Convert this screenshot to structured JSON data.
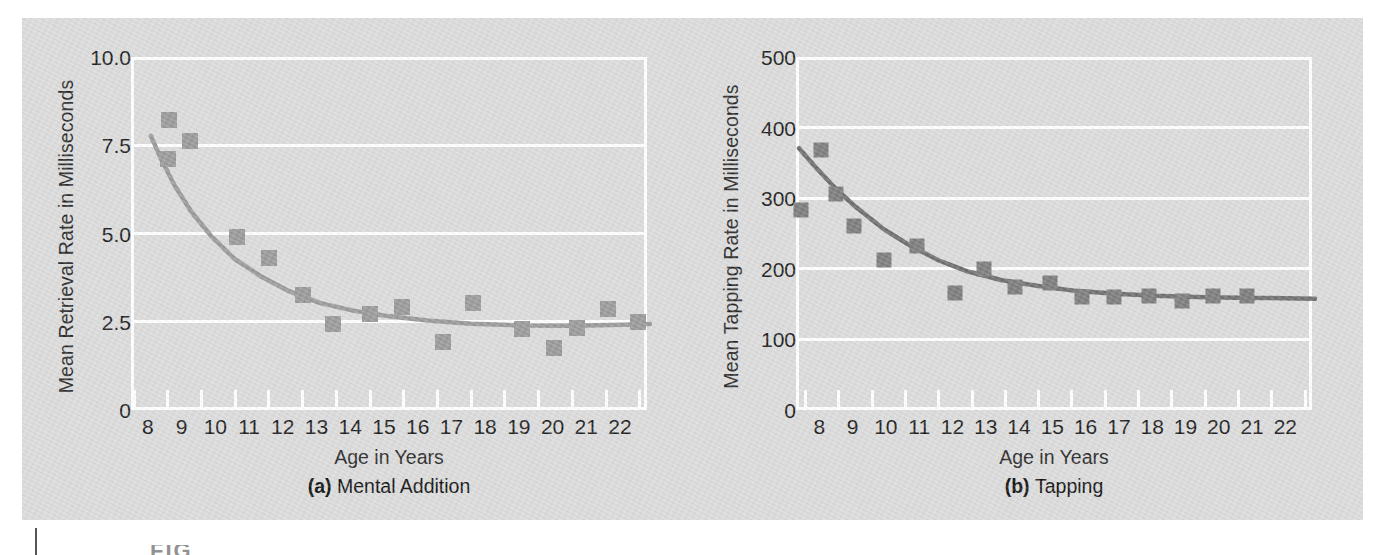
{
  "figure": {
    "background_color": "#dcdcdc",
    "grid_color": "#ffffff",
    "marker_color_a": "#9a9a9a",
    "marker_color_b": "#7d7d7d",
    "curve_color_a": "#9a9a9a",
    "curve_color_b": "#6f6f6f",
    "cut_text": "FIG"
  },
  "chart_data": [
    {
      "type": "scatter",
      "panel": "a",
      "title": "Mental Addition",
      "panel_letter": "(a)",
      "subcaption": "Mental Addition",
      "xlabel": "Age in Years",
      "ylabel": "Mean Retrieval Rate in Milliseconds",
      "xlim": [
        7.5,
        22.8
      ],
      "ylim": [
        0,
        10.0
      ],
      "grid": true,
      "legend": "none",
      "yticks": [
        0,
        2.5,
        5.0,
        7.5,
        10.0
      ],
      "ytick_labels": [
        "0",
        "2.5",
        "5.0",
        "7.5",
        "10.0"
      ],
      "xticks": [
        8,
        9,
        10,
        11,
        12,
        13,
        14,
        15,
        16,
        17,
        18,
        19,
        20,
        21,
        22
      ],
      "xtick_labels": [
        "8",
        "9",
        "10",
        "11",
        "12",
        "13",
        "14",
        "15",
        "16",
        "17",
        "18",
        "19",
        "20",
        "21",
        "22"
      ],
      "points": [
        {
          "x": 8.55,
          "y": 8.3
        },
        {
          "x": 8.5,
          "y": 7.2
        },
        {
          "x": 9.15,
          "y": 7.7
        },
        {
          "x": 10.55,
          "y": 4.98
        },
        {
          "x": 11.5,
          "y": 4.38
        },
        {
          "x": 12.5,
          "y": 3.35
        },
        {
          "x": 13.4,
          "y": 2.52
        },
        {
          "x": 14.5,
          "y": 2.8
        },
        {
          "x": 15.45,
          "y": 3.0
        },
        {
          "x": 16.65,
          "y": 2.0
        },
        {
          "x": 17.55,
          "y": 3.12
        },
        {
          "x": 19.0,
          "y": 2.38
        },
        {
          "x": 19.95,
          "y": 1.85
        },
        {
          "x": 20.65,
          "y": 2.4
        },
        {
          "x": 21.55,
          "y": 2.95
        },
        {
          "x": 22.45,
          "y": 2.57
        }
      ],
      "fit_curve": {
        "description": "decaying power fit",
        "x": [
          8.0,
          8.3,
          8.7,
          9.2,
          9.8,
          10.5,
          11.3,
          12.1,
          13.0,
          14.0,
          15.0,
          16.2,
          17.5,
          19.0,
          20.5,
          22.0,
          22.8
        ],
        "y": [
          7.85,
          7.2,
          6.45,
          5.7,
          5.0,
          4.35,
          3.85,
          3.45,
          3.12,
          2.9,
          2.75,
          2.62,
          2.53,
          2.48,
          2.47,
          2.5,
          2.52
        ]
      }
    },
    {
      "type": "scatter",
      "panel": "b",
      "title": "Tapping",
      "panel_letter": "(b)",
      "subcaption": "Tapping",
      "xlabel": "Age in Years",
      "ylabel": "Mean Tapping Rate in Milliseconds",
      "xlim": [
        7.3,
        22.8
      ],
      "ylim": [
        0,
        500
      ],
      "grid": true,
      "legend": "none",
      "yticks": [
        0,
        100,
        200,
        300,
        400,
        500
      ],
      "ytick_labels": [
        "0",
        "100",
        "200",
        "300",
        "400",
        "500"
      ],
      "xticks": [
        8,
        9,
        10,
        11,
        12,
        13,
        14,
        15,
        16,
        17,
        18,
        19,
        20,
        21,
        22
      ],
      "xtick_labels": [
        "8",
        "9",
        "10",
        "11",
        "12",
        "13",
        "14",
        "15",
        "16",
        "17",
        "18",
        "19",
        "20",
        "21",
        "22"
      ],
      "points": [
        {
          "x": 7.35,
          "y": 288
        },
        {
          "x": 7.95,
          "y": 373
        },
        {
          "x": 8.4,
          "y": 310
        },
        {
          "x": 8.95,
          "y": 265
        },
        {
          "x": 9.85,
          "y": 217
        },
        {
          "x": 10.85,
          "y": 236
        },
        {
          "x": 12.0,
          "y": 170
        },
        {
          "x": 12.85,
          "y": 204
        },
        {
          "x": 13.8,
          "y": 178
        },
        {
          "x": 14.85,
          "y": 184
        },
        {
          "x": 15.8,
          "y": 164
        },
        {
          "x": 16.75,
          "y": 164
        },
        {
          "x": 17.8,
          "y": 166
        },
        {
          "x": 18.8,
          "y": 158
        },
        {
          "x": 19.75,
          "y": 166
        },
        {
          "x": 20.75,
          "y": 166
        }
      ],
      "fit_curve": {
        "description": "decaying exponential fit",
        "x": [
          7.3,
          7.8,
          8.4,
          9.0,
          9.8,
          10.6,
          11.5,
          12.4,
          13.4,
          14.5,
          15.6,
          16.8,
          18.0,
          19.5,
          21.0,
          22.8
        ],
        "y": [
          375,
          348,
          318,
          292,
          262,
          238,
          216,
          200,
          188,
          180,
          173,
          169,
          166,
          164,
          163,
          162
        ]
      }
    }
  ]
}
